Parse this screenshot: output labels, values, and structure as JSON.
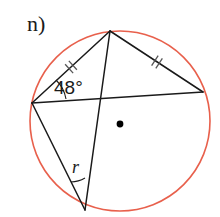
{
  "figure": {
    "width": 220,
    "height": 217,
    "background": "#ffffff",
    "part_label": "n)",
    "angle_label": "48°",
    "radius_label": "r",
    "colors": {
      "circle_stroke": "#e8604c",
      "chord_stroke": "#1a1a1a",
      "text": "#1a1a1a",
      "center_dot": "#000000",
      "tick_stroke": "#555555"
    },
    "circle": {
      "cx": 120,
      "cy": 121,
      "r": 90,
      "stroke_width": 1.6
    },
    "center_dot": {
      "cx": 120,
      "cy": 124,
      "r": 3.4
    },
    "vertices": {
      "top": {
        "x": 110,
        "y": 31,
        "name": "vertex-top"
      },
      "left": {
        "x": 32,
        "y": 103,
        "name": "vertex-left"
      },
      "right": {
        "x": 203,
        "y": 92,
        "name": "vertex-right"
      },
      "bottom": {
        "x": 85,
        "y": 210,
        "name": "vertex-bottom"
      }
    },
    "chords": [
      {
        "name": "chord-left-top",
        "x1": 32,
        "y1": 103,
        "x2": 110,
        "y2": 31,
        "ticks": 1
      },
      {
        "name": "chord-top-right",
        "x1": 110,
        "y1": 31,
        "x2": 203,
        "y2": 92,
        "ticks": 1
      },
      {
        "name": "chord-left-bottom",
        "x1": 32,
        "y1": 103,
        "x2": 85,
        "y2": 210,
        "ticks": 0
      },
      {
        "name": "diagonal-left-right",
        "x1": 32,
        "y1": 103,
        "x2": 203,
        "y2": 92,
        "ticks": 0
      },
      {
        "name": "diagonal-top-bottom",
        "x1": 110,
        "y1": 31,
        "x2": 85,
        "y2": 210,
        "ticks": 0
      }
    ],
    "tick_marks": [
      {
        "name": "tick-mark-left-chord",
        "cx": 71,
        "cy": 67,
        "angle": -42
      },
      {
        "name": "tick-mark-right-chord",
        "cx": 157,
        "cy": 62,
        "angle": 33
      }
    ],
    "angle_arcs": [
      {
        "name": "angle-arc-48",
        "vertex": "left",
        "path": "M 66 99 A 34 34 0 0 0 56 80"
      },
      {
        "name": "angle-arc-r",
        "vertex": "bottom",
        "path": "M 72 181 A 32 32 0 0 0 83 178"
      }
    ]
  }
}
